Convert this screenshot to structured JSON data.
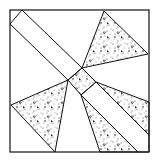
{
  "figure": {
    "stroke_color": "#111111",
    "background_color": "#ffffff",
    "fill_pattern": "stipple-with-triangles",
    "outer_square": [
      [
        10,
        10
      ],
      [
        149,
        10
      ],
      [
        149,
        152
      ],
      [
        10,
        152
      ]
    ],
    "band_top_left": [
      [
        22,
        10
      ],
      [
        82,
        68
      ],
      [
        68,
        80
      ],
      [
        10,
        24
      ]
    ],
    "center_square": [
      [
        68,
        80
      ],
      [
        82,
        68
      ],
      [
        96,
        82
      ],
      [
        81,
        95
      ]
    ],
    "triangle_top_right": [
      [
        104,
        11
      ],
      [
        148,
        54
      ],
      [
        82,
        68
      ]
    ],
    "triangle_left": [
      [
        11,
        105
      ],
      [
        68,
        80
      ],
      [
        55,
        152
      ]
    ],
    "triangle_right": [
      [
        96,
        82
      ],
      [
        149,
        102
      ],
      [
        149,
        135
      ]
    ],
    "triangle_bottom": [
      [
        81,
        95
      ],
      [
        138,
        152
      ],
      [
        100,
        152
      ]
    ],
    "band_bottom_right": [
      [
        96,
        82
      ],
      [
        149,
        135
      ],
      [
        149,
        152
      ],
      [
        138,
        152
      ],
      [
        81,
        95
      ]
    ]
  }
}
